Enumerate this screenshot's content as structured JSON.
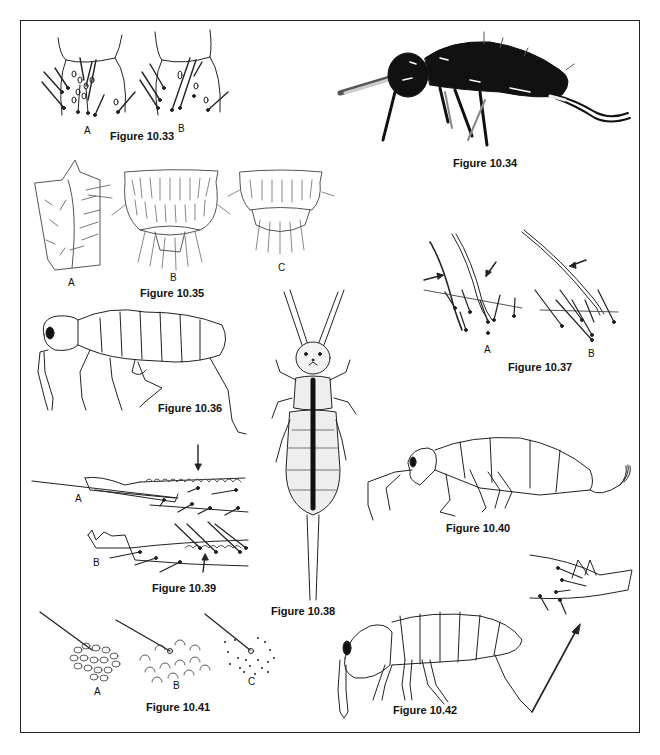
{
  "plate": {
    "figures": [
      {
        "id": "fig-10-33",
        "caption": "Figure 10.33",
        "panels": [
          "A",
          "B"
        ],
        "subject": "setae-detail-dorsal-segment"
      },
      {
        "id": "fig-10-34",
        "caption": "Figure 10.34",
        "panels": [],
        "subject": "dark-springtail-lateral-view"
      },
      {
        "id": "fig-10-35",
        "caption": "Figure 10.35",
        "panels": [
          "A",
          "B",
          "C"
        ],
        "subject": "setose-segments"
      },
      {
        "id": "fig-10-36",
        "caption": "Figure 10.36",
        "panels": [],
        "subject": "springtail-lateral-outline"
      },
      {
        "id": "fig-10-37",
        "caption": "Figure 10.37",
        "panels": [
          "A",
          "B"
        ],
        "subject": "ciliate-setae-with-arrows"
      },
      {
        "id": "fig-10-38",
        "caption": "Figure 10.38",
        "panels": [],
        "subject": "springtail-dorsal-view-striped"
      },
      {
        "id": "fig-10-39",
        "caption": "Figure 10.39",
        "panels": [
          "A",
          "B"
        ],
        "subject": "mucro-dens-detail"
      },
      {
        "id": "fig-10-40",
        "caption": "Figure 10.40",
        "panels": [],
        "subject": "springtail-lateral-outline-long-furca"
      },
      {
        "id": "fig-10-41",
        "caption": "Figure 10.41",
        "panels": [
          "A",
          "B",
          "C"
        ],
        "subject": "cuticle-texture-with-seta"
      },
      {
        "id": "fig-10-42",
        "caption": "Figure 10.42",
        "panels": [],
        "subject": "springtail-lateral-with-furca-inset"
      }
    ]
  }
}
